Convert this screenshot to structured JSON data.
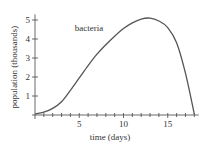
{
  "chart_data": {
    "type": "line",
    "title": "",
    "xlabel": "time (days)",
    "ylabel": "population (thousands)",
    "xlim": [
      0,
      18.5
    ],
    "ylim": [
      0,
      5.3
    ],
    "xticks_major": [
      5,
      10,
      15
    ],
    "xticks_minor_step": 1,
    "yticks": [
      1,
      2,
      3,
      4,
      5
    ],
    "grid": false,
    "legend": null,
    "annotations": [
      {
        "text": "bacteria",
        "x": 4.5,
        "y": 4.4
      }
    ],
    "series": [
      {
        "name": "bacteria",
        "color": "#555555",
        "x": [
          0,
          1,
          2,
          3,
          4,
          5,
          6,
          7,
          8,
          9,
          10,
          11,
          12,
          13,
          14,
          15,
          16,
          17,
          18
        ],
        "values": [
          0.05,
          0.15,
          0.35,
          0.7,
          1.3,
          1.95,
          2.6,
          3.2,
          3.7,
          4.15,
          4.55,
          4.85,
          5.05,
          5.1,
          4.95,
          4.6,
          3.8,
          2.2,
          0.05
        ]
      }
    ]
  }
}
